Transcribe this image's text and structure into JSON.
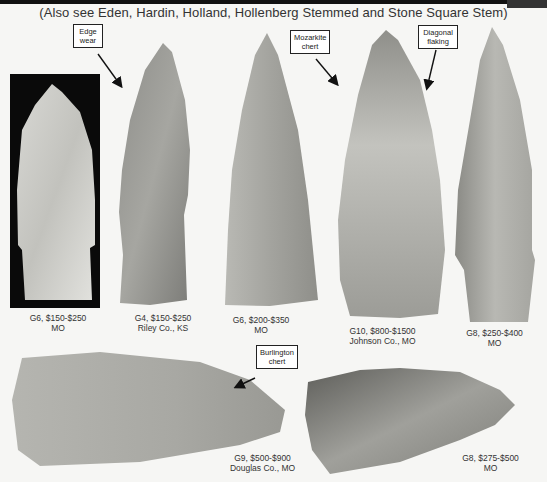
{
  "page": {
    "subtitle": "(Also see Eden, Hardin, Holland, Hollenberg Stemmed and Stone Square Stem)"
  },
  "callouts": [
    {
      "id": "edge-wear",
      "line1": "Edge",
      "line2": "wear"
    },
    {
      "id": "mozarkite-chert",
      "line1": "Mozarkite",
      "line2": "chert"
    },
    {
      "id": "diagonal-flaking",
      "line1": "Diagonal",
      "line2": "flaking"
    },
    {
      "id": "burlington-chert",
      "line1": "Burlington",
      "line2": "chert"
    }
  ],
  "artifacts": [
    {
      "grade": "G6, $150-$250",
      "location": "MO"
    },
    {
      "grade": "G4, $150-$250",
      "location": "Riley Co., KS"
    },
    {
      "grade": "G6, $200-$350",
      "location": "MO"
    },
    {
      "grade": "G10, $800-$1500",
      "location": "Johnson Co., MO"
    },
    {
      "grade": "G8, $250-$400",
      "location": "MO"
    },
    {
      "grade": "G9, $500-$900",
      "location": "Douglas Co., MO"
    },
    {
      "grade": "G8, $275-$500",
      "location": "MO"
    }
  ],
  "colors": {
    "page_background": "#f6f6f4",
    "stone_gray": "#9a9a96",
    "dark_panel": "#0a0a0a"
  }
}
